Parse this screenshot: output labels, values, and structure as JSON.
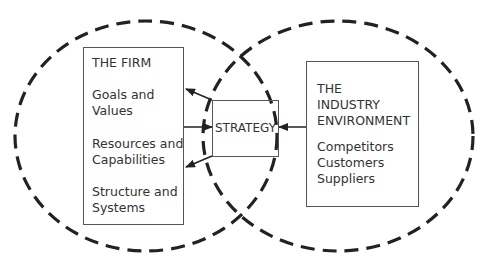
{
  "diagram": {
    "firm": {
      "title": "THE FIRM",
      "items": [
        "Goals and",
        "Values",
        "Resources and",
        "Capabilities",
        "Structure and",
        "Systems"
      ]
    },
    "strategy": {
      "label": "STRATEGY"
    },
    "industry": {
      "title_lines": [
        "THE",
        "INDUSTRY",
        "ENVIRONMENT"
      ],
      "items": [
        "Competitors",
        "Customers",
        "Suppliers"
      ]
    },
    "colors": {
      "line": "#222222",
      "box_border": "#555555",
      "text": "#333333"
    }
  }
}
